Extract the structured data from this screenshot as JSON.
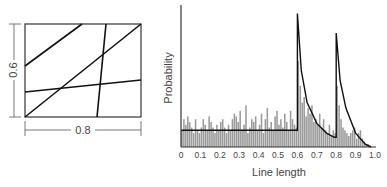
{
  "chart_data": [
    {
      "type": "diagram",
      "title": "",
      "description": "Rectangle of width 0.8 and height 0.6 crossed by four random lines",
      "dimensions": {
        "width_label": "0.8",
        "height_label": "0.6"
      },
      "lines": [
        {
          "from": [
            0.0,
            0.33
          ],
          "to": [
            0.39,
            0.6
          ]
        },
        {
          "from": [
            0.0,
            0.0
          ],
          "to": [
            0.8,
            0.6
          ]
        },
        {
          "from": [
            0.0,
            0.16
          ],
          "to": [
            0.8,
            0.24
          ]
        },
        {
          "from": [
            0.56,
            0.6
          ],
          "to": [
            0.5,
            0.0
          ]
        }
      ]
    },
    {
      "type": "bar",
      "title": "",
      "xlabel": "Line length",
      "ylabel": "Probability",
      "xlim": [
        0,
        1.0
      ],
      "xticks": [
        "0",
        "0.1",
        "0.2",
        "0.3",
        "0.4",
        "0.5",
        "0.6",
        "0.7",
        "0.8",
        "0.9",
        "1.0"
      ],
      "grid": false,
      "legend": null,
      "series": [
        {
          "name": "Simulated histogram",
          "kind": "bar",
          "note": "Noisy histogram around a flat level from 0 to 0.6, spikes at 0.6 and 0.8 decaying afterwards, tailing to 0 near 1.0",
          "bin_width": 0.01,
          "relative_heights": [
            0.12,
            0.2,
            0.16,
            0.22,
            0.18,
            0.14,
            0.1,
            0.2,
            0.12,
            0.1,
            0.14,
            0.2,
            0.16,
            0.12,
            0.22,
            0.18,
            0.14,
            0.1,
            0.16,
            0.12,
            0.18,
            0.2,
            0.14,
            0.1,
            0.16,
            0.12,
            0.2,
            0.24,
            0.22,
            0.18,
            0.26,
            0.12,
            0.16,
            0.3,
            0.1,
            0.14,
            0.2,
            0.18,
            0.22,
            0.12,
            0.16,
            0.24,
            0.1,
            0.2,
            0.28,
            0.14,
            0.18,
            0.12,
            0.22,
            0.26,
            0.16,
            0.2,
            0.14,
            0.24,
            0.18,
            0.12,
            0.26,
            0.2,
            0.16,
            0.14,
            0.62,
            0.44,
            0.32,
            0.36,
            0.22,
            0.28,
            0.24,
            0.3,
            0.18,
            0.2,
            0.16,
            0.24,
            0.14,
            0.2,
            0.12,
            0.1,
            0.16,
            0.08,
            0.12,
            0.1,
            0.44,
            0.3,
            0.2,
            0.14,
            0.12,
            0.1,
            0.08,
            0.1,
            0.12,
            0.14,
            0.06,
            0.1,
            0.12,
            0.06,
            0.04,
            0.02,
            0.02,
            0.01,
            0.0,
            0.0
          ]
        },
        {
          "name": "Theoretical density",
          "kind": "line",
          "x": [
            0.0,
            0.6,
            0.6,
            0.62,
            0.65,
            0.7,
            0.75,
            0.79,
            0.8,
            0.8,
            0.82,
            0.85,
            0.9,
            0.95,
            0.98
          ],
          "relative_y": [
            0.12,
            0.12,
            0.96,
            0.55,
            0.32,
            0.17,
            0.1,
            0.07,
            0.07,
            0.82,
            0.48,
            0.28,
            0.1,
            0.02,
            0.0
          ]
        }
      ]
    }
  ],
  "left_panel": {
    "height_label": "0.6",
    "width_label": "0.8"
  },
  "right_panel": {
    "ylabel": "Probability",
    "xlabel": "Line length",
    "xticks": [
      "0",
      "0.1",
      "0.2",
      "0.3",
      "0.4",
      "0.5",
      "0.6",
      "0.7",
      "0.8",
      "0.9",
      "1.0"
    ]
  }
}
